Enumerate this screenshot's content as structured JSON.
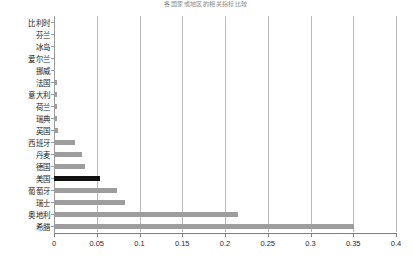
{
  "chart": {
    "title": "各国家或地区的相关指标比较",
    "type": "bar-horizontal"
  },
  "axis": {
    "x_tick_labels": [
      "0",
      "0.05",
      "0.1",
      "0.15",
      "0.2",
      "0.25",
      "0.3",
      "0.35",
      "0.4"
    ],
    "x_tick_values": [
      0,
      0.05,
      0.1,
      0.15,
      0.2,
      0.25,
      0.3,
      0.35,
      0.4
    ],
    "x_min": 0,
    "x_max": 0.4
  },
  "colors": {
    "bar": "#9d9d9d",
    "bar_highlight": "#111111",
    "gridline": "#b9b9b9",
    "axis": "#7d7d7d"
  },
  "categories": [
    "比利时",
    "芬兰",
    "冰岛",
    "爱尔兰",
    "挪威",
    "法国",
    "意大利",
    "荷兰",
    "瑞典",
    "英国",
    "西班牙",
    "丹麦",
    "德国",
    "美国",
    "葡萄牙",
    "瑞士",
    "奥地利",
    "希腊"
  ],
  "values": [
    0.0,
    0.0,
    0.0,
    0.0,
    0.0,
    0.004,
    0.004,
    0.004,
    0.004,
    0.005,
    0.025,
    0.033,
    0.036,
    0.054,
    0.074,
    0.083,
    0.215,
    0.351
  ],
  "highlight_index": 13,
  "chart_data": {
    "type": "bar",
    "title": "各国家或地区的相关指标比较",
    "xlabel": "",
    "ylabel": "",
    "orientation": "horizontal",
    "grid": true,
    "legend": "none",
    "xlim": [
      0,
      0.4
    ],
    "xticks": [
      0,
      0.05,
      0.1,
      0.15,
      0.2,
      0.25,
      0.3,
      0.35,
      0.4
    ],
    "categories": [
      "比利时",
      "芬兰",
      "冰岛",
      "爱尔兰",
      "挪威",
      "法国",
      "意大利",
      "荷兰",
      "瑞典",
      "英国",
      "西班牙",
      "丹麦",
      "德国",
      "美国",
      "葡萄牙",
      "瑞士",
      "奥地利",
      "希腊"
    ],
    "values": [
      0.0,
      0.0,
      0.0,
      0.0,
      0.0,
      0.004,
      0.004,
      0.004,
      0.004,
      0.005,
      0.025,
      0.033,
      0.036,
      0.054,
      0.074,
      0.083,
      0.215,
      0.351
    ],
    "highlighted_category": "美国",
    "highlight_color": "#111111",
    "bar_color": "#9d9d9d"
  }
}
